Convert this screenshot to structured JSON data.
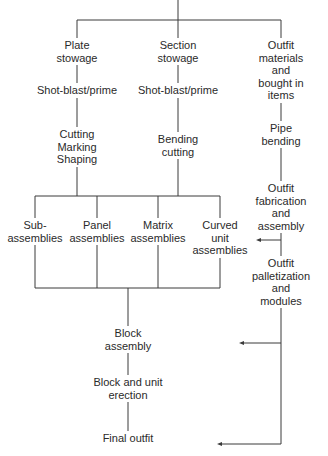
{
  "diagram": {
    "type": "process flowchart",
    "line_color": "#3a3a3a",
    "nodes": {
      "plate_stowage": "Plate\nstowage",
      "plate_shotblast": "Shot-blast/prime",
      "plate_cutting": "Cutting\nMarking\nShaping",
      "section_stowage": "Section\nstowage",
      "section_shotblast": "Shot-blast/prime",
      "section_bending": "Bending\ncutting",
      "outfit_materials": "Outfit materials\nand bought in\nitems",
      "pipe_bending": "Pipe bending",
      "outfit_fabrication": "Outfit\nfabrication\nand assembly",
      "outfit_palletization": "Outfit\npalletization\nand\nmodules",
      "sub_assemblies": "Sub-\nassemblies",
      "panel_assemblies": "Panel\nassemblies",
      "matrix_assemblies": "Matrix\nassemblies",
      "curved_unit_assemblies": "Curved\nunit\nassemblies",
      "block_assembly": "Block\nassembly",
      "block_unit_erection": "Block and unit\nerection",
      "final_outfit": "Final outfit"
    },
    "edges": [
      [
        "start",
        "plate_stowage"
      ],
      [
        "start",
        "section_stowage"
      ],
      [
        "start",
        "outfit_materials"
      ],
      [
        "plate_stowage",
        "plate_shotblast"
      ],
      [
        "plate_shotblast",
        "plate_cutting"
      ],
      [
        "section_stowage",
        "section_shotblast"
      ],
      [
        "section_shotblast",
        "section_bending"
      ],
      [
        "outfit_materials",
        "pipe_bending"
      ],
      [
        "pipe_bending",
        "outfit_fabrication"
      ],
      [
        "outfit_fabrication",
        "outfit_palletization"
      ],
      [
        "plate_cutting",
        "assembly_bus"
      ],
      [
        "section_bending",
        "assembly_bus"
      ],
      [
        "assembly_bus",
        "sub_assemblies"
      ],
      [
        "assembly_bus",
        "panel_assemblies"
      ],
      [
        "assembly_bus",
        "matrix_assemblies"
      ],
      [
        "assembly_bus",
        "curved_unit_assemblies"
      ],
      [
        "outfit_fabrication",
        "curved_unit_assemblies"
      ],
      [
        "sub_assemblies",
        "block_assembly"
      ],
      [
        "panel_assemblies",
        "block_assembly"
      ],
      [
        "matrix_assemblies",
        "block_assembly"
      ],
      [
        "curved_unit_assemblies",
        "block_assembly"
      ],
      [
        "outfit_palletization",
        "block_assembly"
      ],
      [
        "block_assembly",
        "block_unit_erection"
      ],
      [
        "block_unit_erection",
        "final_outfit"
      ],
      [
        "outfit_palletization",
        "final_outfit"
      ]
    ]
  }
}
